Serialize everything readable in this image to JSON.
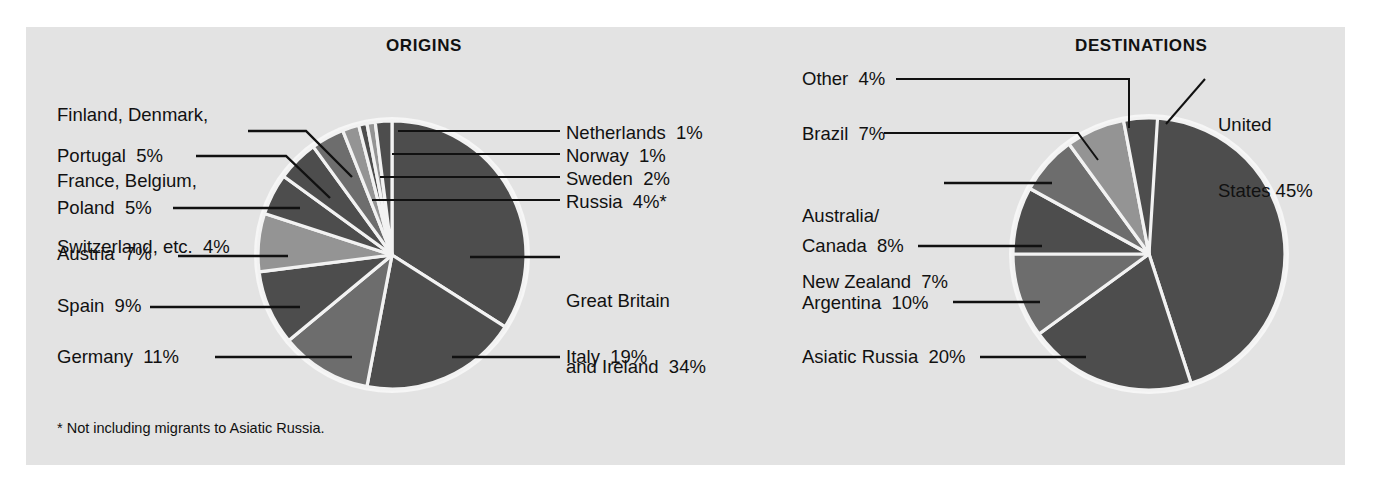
{
  "figure": {
    "background_color": "#e3e3e3",
    "page_color": "#ffffff",
    "footnote": "* Not including migrants to Asiatic Russia.",
    "colors": {
      "dark": "#4d4d4d",
      "mid": "#6d6d6d",
      "light": "#949494",
      "separator": "#f2f2f2",
      "text": "#111111"
    }
  },
  "chart_data": [
    {
      "type": "pie",
      "title": "ORIGINS",
      "id": "origins",
      "note": "* Not including migrants to Asiatic Russia.",
      "start_angle_deg": 0,
      "direction": "clockwise",
      "categories": [
        "Great Britain and Ireland",
        "Italy",
        "Germany",
        "Spain",
        "Austria",
        "Poland",
        "Portugal",
        "Finland, Denmark, France, Belgium, Switzerland, etc.",
        "Sweden",
        "Norway",
        "Netherlands",
        "Russia"
      ],
      "values": [
        34,
        19,
        11,
        9,
        7,
        5,
        5,
        4,
        2,
        1,
        1,
        4
      ],
      "labels": [
        {
          "text": "Great Britain\nand Ireland  34%",
          "value": 34,
          "name": "Great Britain and Ireland",
          "side": "right"
        },
        {
          "text": "Italy  19%",
          "value": 19,
          "name": "Italy",
          "side": "right"
        },
        {
          "text": "Germany  11%",
          "value": 11,
          "name": "Germany",
          "side": "left"
        },
        {
          "text": "Spain  9%",
          "value": 9,
          "name": "Spain",
          "side": "left"
        },
        {
          "text": "Austria  7%",
          "value": 7,
          "name": "Austria",
          "side": "left"
        },
        {
          "text": "Poland  5%",
          "value": 5,
          "name": "Poland",
          "side": "left"
        },
        {
          "text": "Portugal  5%",
          "value": 5,
          "name": "Portugal",
          "side": "left"
        },
        {
          "text": "Finland, Denmark,\nFrance, Belgium,\nSwitzerland, etc.  4%",
          "value": 4,
          "name": "Finland, Denmark, France, Belgium, Switzerland, etc.",
          "side": "left"
        },
        {
          "text": "Russia  4%*",
          "value": 4,
          "name": "Russia",
          "side": "right"
        },
        {
          "text": "Sweden  2%",
          "value": 2,
          "name": "Sweden",
          "side": "right"
        },
        {
          "text": "Norway  1%",
          "value": 1,
          "name": "Norway",
          "side": "right"
        },
        {
          "text": "Netherlands  1%",
          "value": 1,
          "name": "Netherlands",
          "side": "right"
        }
      ]
    },
    {
      "type": "pie",
      "title": "DESTINATIONS",
      "id": "destinations",
      "start_angle_deg": 0,
      "direction": "clockwise",
      "categories": [
        "United States",
        "Asiatic Russia",
        "Argentina",
        "Canada",
        "Australia/New Zealand",
        "Brazil",
        "Other"
      ],
      "values": [
        45,
        20,
        10,
        8,
        7,
        7,
        4
      ],
      "labels": [
        {
          "text": "United\nStates 45%",
          "value": 45,
          "name": "United States",
          "side": "right"
        },
        {
          "text": "Asiatic Russia  20%",
          "value": 20,
          "name": "Asiatic Russia",
          "side": "left"
        },
        {
          "text": "Argentina  10%",
          "value": 10,
          "name": "Argentina",
          "side": "left"
        },
        {
          "text": "Canada  8%",
          "value": 8,
          "name": "Canada",
          "side": "left"
        },
        {
          "text": "Australia/\nNew Zealand  7%",
          "value": 7,
          "name": "Australia/New Zealand",
          "side": "left"
        },
        {
          "text": "Brazil  7%",
          "value": 7,
          "name": "Brazil",
          "side": "left"
        },
        {
          "text": "Other  4%",
          "value": 4,
          "name": "Other",
          "side": "left"
        }
      ]
    }
  ],
  "origins": {
    "title": "ORIGINS",
    "labels": {
      "finland_group_l1": "Finland, Denmark,",
      "finland_group_l2": "France, Belgium,",
      "finland_group_l3": "Switzerland, etc.  4%",
      "portugal": "Portugal  5%",
      "poland": "Poland  5%",
      "austria": "Austria  7%",
      "spain": "Spain  9%",
      "germany": "Germany  11%",
      "netherlands": "Netherlands  1%",
      "norway": "Norway  1%",
      "sweden": "Sweden  2%",
      "russia": "Russia  4%*",
      "great_britain_l1": "Great Britain",
      "great_britain_l2": "and Ireland  34%",
      "italy": "Italy  19%"
    },
    "footnote": "* Not including migrants to Asiatic Russia."
  },
  "destinations": {
    "title": "DESTINATIONS",
    "labels": {
      "other": "Other  4%",
      "brazil": "Brazil  7%",
      "australia_nz_l1": "Australia/",
      "australia_nz_l2": "New Zealand  7%",
      "canada": "Canada  8%",
      "argentina": "Argentina  10%",
      "asiatic_russia": "Asiatic Russia  20%",
      "united_states_l1": "United",
      "united_states_l2": "States 45%"
    }
  }
}
